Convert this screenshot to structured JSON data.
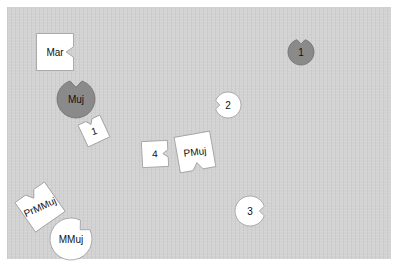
{
  "board": {
    "background": "#d2d2d2"
  },
  "pieces": [
    {
      "id": "mar",
      "shape": "square",
      "label": "Mar",
      "fill": "#ffffff",
      "cx": 55,
      "cy": 52,
      "size": 37,
      "rotate": 0,
      "notch": "right"
    },
    {
      "id": "muj",
      "shape": "circle",
      "label": "Muj",
      "fill": "#8a8a8a",
      "cx": 76,
      "cy": 99,
      "r": 19,
      "notch": "top"
    },
    {
      "id": "one-dark",
      "shape": "circle",
      "label": "1",
      "fill": "#8a8a8a",
      "cx": 301,
      "cy": 52,
      "r": 13,
      "notch": "top"
    },
    {
      "id": "one-square",
      "shape": "square",
      "label": "1",
      "fill": "#ffffff",
      "cx": 94,
      "cy": 131,
      "size": 24,
      "rotate": -25,
      "notch": "top"
    },
    {
      "id": "two",
      "shape": "circle",
      "label": "2",
      "fill": "#ffffff",
      "cx": 228,
      "cy": 105,
      "r": 13,
      "notch": "left"
    },
    {
      "id": "four",
      "shape": "square",
      "label": "4",
      "fill": "#ffffff",
      "cx": 155,
      "cy": 154,
      "size": 26,
      "rotate": -3,
      "notch": "right"
    },
    {
      "id": "pmuj",
      "shape": "square",
      "label": "PMuj",
      "fill": "#ffffff",
      "cx": 195,
      "cy": 152,
      "size": 36,
      "rotate": -10,
      "notch": "bottom"
    },
    {
      "id": "three",
      "shape": "circle",
      "label": "3",
      "fill": "#ffffff",
      "cx": 250,
      "cy": 211,
      "r": 15,
      "notch": "right"
    },
    {
      "id": "prmmuj",
      "shape": "square",
      "label": "PrMMuj",
      "fill": "#ffffff",
      "cx": 40,
      "cy": 207,
      "size": 36,
      "rotate": -35,
      "notch": "top"
    },
    {
      "id": "mmuj",
      "shape": "circle",
      "label": "MMuj",
      "fill": "#ffffff",
      "cx": 71,
      "cy": 239,
      "r": 21,
      "notch": "upper-right"
    }
  ]
}
